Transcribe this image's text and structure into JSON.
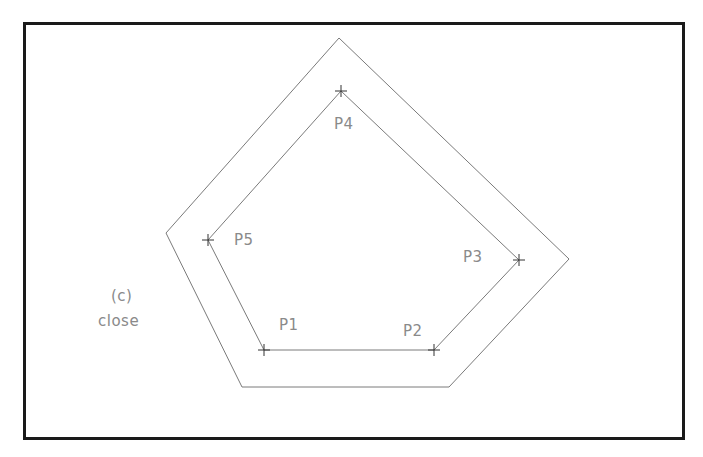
{
  "figure": {
    "panel_label": "(c)",
    "command_label": "close",
    "points": [
      {
        "name": "P1",
        "x": 264,
        "y": 350,
        "label_x": 279,
        "label_y": 318
      },
      {
        "name": "P2",
        "x": 434,
        "y": 350,
        "label_x": 403,
        "label_y": 324
      },
      {
        "name": "P3",
        "x": 519,
        "y": 260,
        "label_x": 463,
        "label_y": 250
      },
      {
        "name": "P4",
        "x": 341,
        "y": 91,
        "label_x": 334,
        "label_y": 117
      },
      {
        "name": "P5",
        "x": 208,
        "y": 240,
        "label_x": 234,
        "label_y": 233
      }
    ],
    "inner_polyline": "264,350 434,350 519,260 341,91 208,240 264,350",
    "outer_polygon": "242,387 449,387 569,259 339,38 166,233",
    "colors": {
      "frame": "#1a1a1a",
      "lines": "#7a7a7a",
      "text": "#8a8a8a"
    }
  }
}
